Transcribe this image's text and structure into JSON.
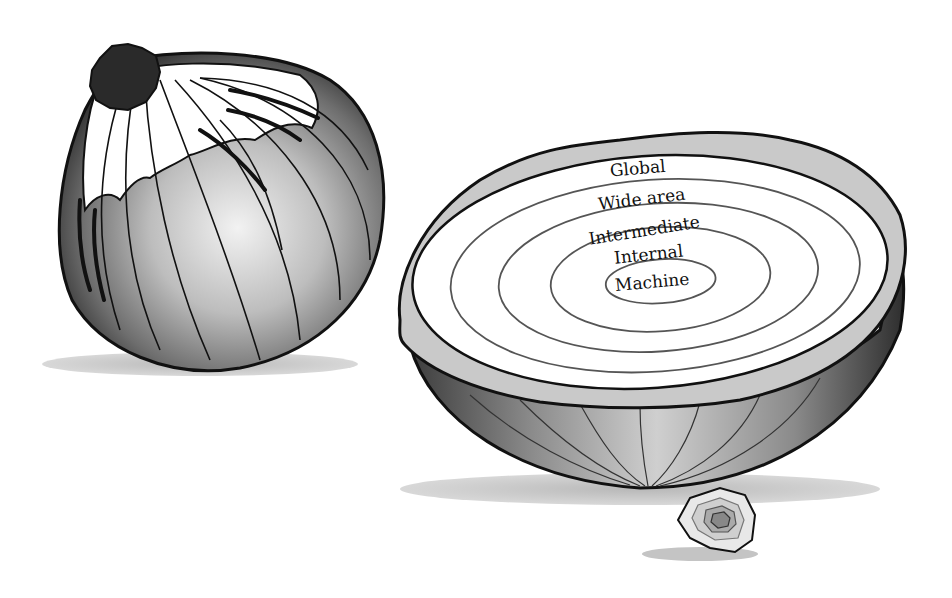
{
  "diagram": {
    "type": "onion-layers",
    "layers": [
      {
        "label": "Global",
        "order": 5
      },
      {
        "label": "Wide area",
        "order": 4
      },
      {
        "label": "Intermediate",
        "order": 3
      },
      {
        "label": "Internal",
        "order": 2
      },
      {
        "label": "Machine",
        "order": 1
      }
    ]
  },
  "colors": {
    "background": "#ffffff",
    "outline": "#111111",
    "onion_dark": "#3a3a3a",
    "onion_mid": "#8a8a8a",
    "onion_light": "#e6e6e6",
    "cut_face": "#ffffff",
    "skin_edge": "#c8c8c8",
    "shadow": "#bdbdbd",
    "root": "#2b2b2b"
  }
}
